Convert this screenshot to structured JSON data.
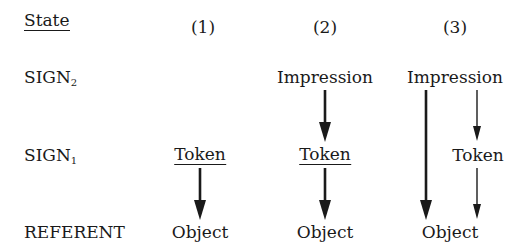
{
  "header": {
    "state_label": "State",
    "columns": [
      "(1)",
      "(2)",
      "(3)"
    ]
  },
  "rows": {
    "sign2": {
      "label": "SIGN",
      "subscript": "2"
    },
    "sign1": {
      "label": "SIGN",
      "subscript": "1"
    },
    "referent": {
      "label": "REFERENT"
    }
  },
  "cells": {
    "col1": {
      "sign1": "Token",
      "referent": "Object"
    },
    "col2": {
      "sign2": "Impression",
      "sign1": "Token",
      "referent": "Object"
    },
    "col3": {
      "sign2": "Impression",
      "sign1": "Token",
      "referent": "Object"
    }
  },
  "arrows": [
    {
      "column": 1,
      "from": "Token",
      "to": "Object",
      "weight": "thick"
    },
    {
      "column": 2,
      "from": "Impression",
      "to": "Token",
      "weight": "thick"
    },
    {
      "column": 2,
      "from": "Token",
      "to": "Object",
      "weight": "thick"
    },
    {
      "column": 3,
      "from": "Impression",
      "to": "Object",
      "weight": "thick"
    },
    {
      "column": 3,
      "from": "Impression",
      "to": "Token",
      "weight": "thin"
    },
    {
      "column": 3,
      "from": "Token",
      "to": "Object",
      "weight": "thin"
    }
  ]
}
